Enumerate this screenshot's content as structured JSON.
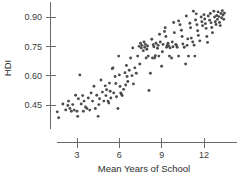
{
  "chart_data": {
    "type": "scatter",
    "title": "",
    "xlabel": "Mean Years of School",
    "ylabel": "HDI",
    "xlim": [
      1.2,
      13.6
    ],
    "ylim": [
      0.36,
      0.97
    ],
    "grid": false,
    "legend": null,
    "xticks": [
      3,
      6,
      9,
      12
    ],
    "xtick_labels": [
      "3",
      "6",
      "9",
      "12"
    ],
    "yticks": [
      0.45,
      0.6,
      0.75,
      0.9
    ],
    "ytick_labels": [
      "0.45",
      "0.60",
      "0.75",
      "0.90"
    ],
    "point_color": "#4c4c4c",
    "axis_color": "#6b6b6b",
    "point_count": 172,
    "points": [
      [
        1.6,
        0.415
      ],
      [
        1.7,
        0.385
      ],
      [
        2.0,
        0.455
      ],
      [
        2.2,
        0.425
      ],
      [
        2.4,
        0.47
      ],
      [
        2.5,
        0.432
      ],
      [
        2.6,
        0.418
      ],
      [
        2.7,
        0.452
      ],
      [
        2.8,
        0.424
      ],
      [
        2.9,
        0.5
      ],
      [
        3.0,
        0.418
      ],
      [
        3.05,
        0.392
      ],
      [
        3.1,
        0.482
      ],
      [
        3.2,
        0.604
      ],
      [
        3.3,
        0.455
      ],
      [
        3.4,
        0.498
      ],
      [
        3.5,
        0.47
      ],
      [
        3.6,
        0.44
      ],
      [
        3.7,
        0.432
      ],
      [
        3.8,
        0.486
      ],
      [
        3.9,
        0.424
      ],
      [
        4.0,
        0.512
      ],
      [
        4.1,
        0.47
      ],
      [
        4.2,
        0.546
      ],
      [
        4.3,
        0.432
      ],
      [
        4.4,
        0.5
      ],
      [
        4.5,
        0.392
      ],
      [
        4.6,
        0.482
      ],
      [
        4.7,
        0.578
      ],
      [
        4.8,
        0.516
      ],
      [
        4.9,
        0.47
      ],
      [
        5.0,
        0.548
      ],
      [
        5.05,
        0.498
      ],
      [
        5.1,
        0.528
      ],
      [
        5.2,
        0.47
      ],
      [
        5.3,
        0.562
      ],
      [
        5.35,
        0.52
      ],
      [
        5.4,
        0.486
      ],
      [
        5.5,
        0.636
      ],
      [
        5.55,
        0.64
      ],
      [
        5.6,
        0.512
      ],
      [
        5.7,
        0.596
      ],
      [
        5.75,
        0.56
      ],
      [
        5.8,
        0.492
      ],
      [
        5.9,
        0.432
      ],
      [
        6.0,
        0.604
      ],
      [
        6.05,
        0.545
      ],
      [
        6.1,
        0.512
      ],
      [
        6.15,
        0.505
      ],
      [
        6.2,
        0.498
      ],
      [
        6.3,
        0.53
      ],
      [
        6.4,
        0.615
      ],
      [
        6.5,
        0.652
      ],
      [
        6.55,
        0.596
      ],
      [
        6.6,
        0.57
      ],
      [
        6.7,
        0.628
      ],
      [
        6.8,
        0.69
      ],
      [
        6.9,
        0.6
      ],
      [
        7.0,
        0.558
      ],
      [
        7.1,
        0.64
      ],
      [
        7.2,
        0.612
      ],
      [
        7.3,
        0.7
      ],
      [
        7.4,
        0.75
      ],
      [
        7.5,
        0.766
      ],
      [
        7.55,
        0.742
      ],
      [
        7.6,
        0.755
      ],
      [
        7.7,
        0.728
      ],
      [
        7.75,
        0.772
      ],
      [
        7.8,
        0.745
      ],
      [
        7.85,
        0.76
      ],
      [
        7.9,
        0.69
      ],
      [
        7.95,
        0.735
      ],
      [
        8.0,
        0.752
      ],
      [
        8.05,
        0.7
      ],
      [
        8.1,
        0.524
      ],
      [
        8.2,
        0.612
      ],
      [
        8.3,
        0.786
      ],
      [
        8.4,
        0.758
      ],
      [
        8.45,
        0.748
      ],
      [
        8.5,
        0.69
      ],
      [
        8.55,
        0.702
      ],
      [
        8.6,
        0.766
      ],
      [
        8.7,
        0.74
      ],
      [
        8.75,
        0.755
      ],
      [
        8.8,
        0.7
      ],
      [
        8.9,
        0.772
      ],
      [
        9.0,
        0.648
      ],
      [
        9.05,
        0.722
      ],
      [
        9.1,
        0.76
      ],
      [
        9.2,
        0.826
      ],
      [
        9.3,
        0.8
      ],
      [
        9.35,
        0.745
      ],
      [
        9.4,
        0.755
      ],
      [
        9.45,
        0.766
      ],
      [
        9.5,
        0.752
      ],
      [
        9.55,
        0.7
      ],
      [
        9.6,
        0.742
      ],
      [
        9.7,
        0.69
      ],
      [
        9.75,
        0.772
      ],
      [
        9.8,
        0.748
      ],
      [
        9.9,
        0.82
      ],
      [
        10.0,
        0.76
      ],
      [
        10.05,
        0.755
      ],
      [
        10.1,
        0.745
      ],
      [
        10.2,
        0.7
      ],
      [
        10.3,
        0.86
      ],
      [
        10.4,
        0.832
      ],
      [
        10.45,
        0.8
      ],
      [
        10.5,
        0.762
      ],
      [
        10.6,
        0.745
      ],
      [
        10.7,
        0.66
      ],
      [
        10.8,
        0.755
      ],
      [
        10.85,
        0.788
      ],
      [
        10.9,
        0.7
      ],
      [
        11.0,
        0.868
      ],
      [
        11.05,
        0.845
      ],
      [
        11.1,
        0.792
      ],
      [
        11.2,
        0.772
      ],
      [
        11.3,
        0.756
      ],
      [
        11.35,
        0.7
      ],
      [
        11.4,
        0.885
      ],
      [
        11.5,
        0.86
      ],
      [
        11.55,
        0.83
      ],
      [
        11.6,
        0.806
      ],
      [
        11.7,
        0.778
      ],
      [
        11.8,
        0.9
      ],
      [
        11.85,
        0.876
      ],
      [
        11.9,
        0.855
      ],
      [
        12.0,
        0.912
      ],
      [
        12.05,
        0.89
      ],
      [
        12.1,
        0.866
      ],
      [
        12.15,
        0.842
      ],
      [
        12.2,
        0.8
      ],
      [
        12.25,
        0.77
      ],
      [
        12.3,
        0.905
      ],
      [
        12.4,
        0.884
      ],
      [
        12.45,
        0.918
      ],
      [
        12.5,
        0.87
      ],
      [
        12.55,
        0.846
      ],
      [
        12.6,
        0.82
      ],
      [
        12.7,
        0.93
      ],
      [
        12.75,
        0.9
      ],
      [
        12.8,
        0.876
      ],
      [
        12.85,
        0.862
      ],
      [
        12.9,
        0.908
      ],
      [
        12.95,
        0.888
      ],
      [
        13.0,
        0.926
      ],
      [
        13.05,
        0.902
      ],
      [
        13.1,
        0.872
      ],
      [
        13.15,
        0.856
      ],
      [
        13.2,
        0.918
      ],
      [
        13.25,
        0.896
      ],
      [
        13.3,
        0.932
      ],
      [
        13.35,
        0.91
      ],
      [
        13.4,
        0.888
      ],
      [
        13.45,
        0.92
      ],
      [
        11.25,
        0.93
      ],
      [
        11.45,
        0.916
      ],
      [
        10.75,
        0.905
      ],
      [
        10.2,
        0.88
      ],
      [
        9.85,
        0.872
      ],
      [
        9.25,
        0.845
      ],
      [
        8.85,
        0.812
      ],
      [
        8.35,
        0.69
      ],
      [
        7.45,
        0.66
      ],
      [
        6.95,
        0.742
      ],
      [
        6.45,
        0.552
      ],
      [
        5.95,
        0.7
      ],
      [
        5.25,
        0.46
      ],
      [
        4.55,
        0.452
      ],
      [
        3.45,
        0.418
      ],
      [
        2.35,
        0.448
      ]
    ]
  }
}
